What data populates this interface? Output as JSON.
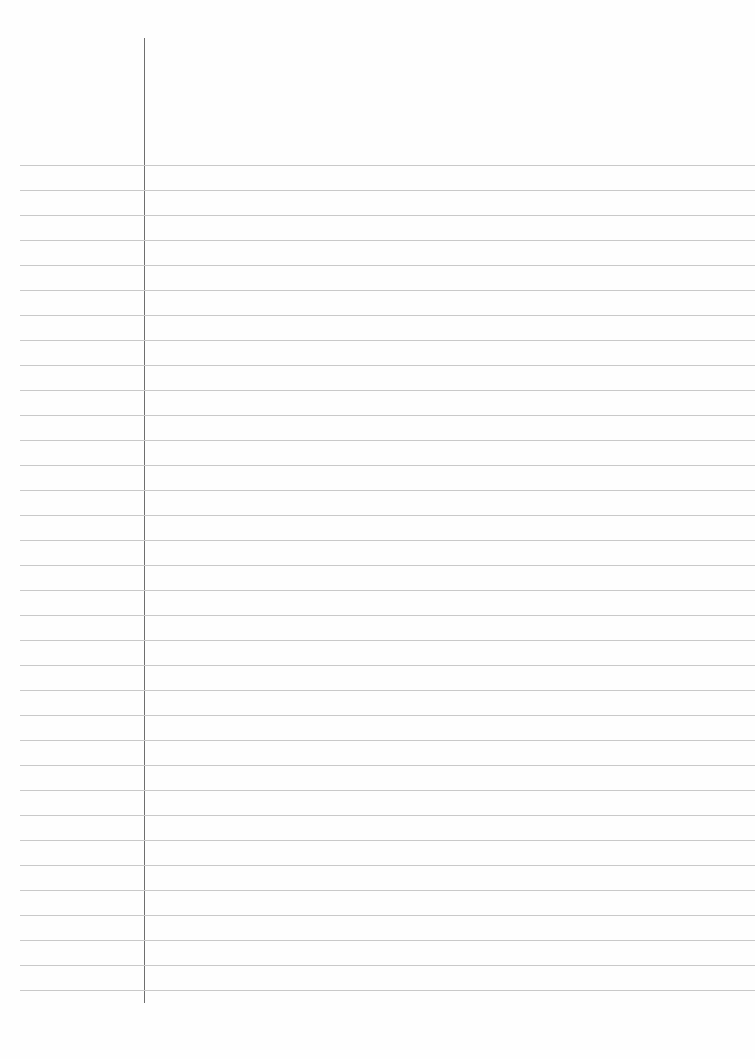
{
  "paper": {
    "type": "lined notebook page",
    "line_count": 34,
    "first_line_y": 165,
    "line_spacing": 25,
    "margin_x": 144,
    "colors": {
      "background": "#fefefe",
      "rule": "#c9c9c9",
      "margin": "#6e6e6e"
    }
  }
}
